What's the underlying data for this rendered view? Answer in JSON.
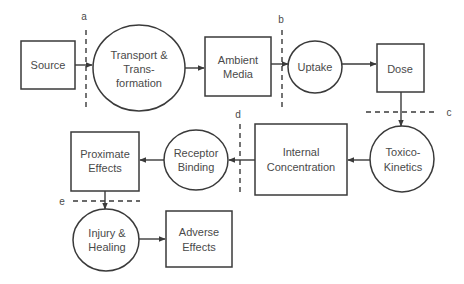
{
  "diagram": {
    "nodes": [
      {
        "id": "source",
        "shape": "rect",
        "lines": [
          "Source"
        ]
      },
      {
        "id": "transport",
        "shape": "ellipse",
        "lines": [
          "Transport &",
          "Trans-",
          "formation"
        ]
      },
      {
        "id": "ambient",
        "shape": "rect",
        "lines": [
          "Ambient",
          "Media"
        ]
      },
      {
        "id": "uptake",
        "shape": "ellipse",
        "lines": [
          "Uptake"
        ]
      },
      {
        "id": "dose",
        "shape": "rect",
        "lines": [
          "Dose"
        ]
      },
      {
        "id": "toxicokinetics",
        "shape": "ellipse",
        "lines": [
          "Toxico-",
          "Kinetics"
        ]
      },
      {
        "id": "internal",
        "shape": "rect",
        "lines": [
          "Internal",
          "Concentration"
        ]
      },
      {
        "id": "receptor",
        "shape": "ellipse",
        "lines": [
          "Receptor",
          "Binding"
        ]
      },
      {
        "id": "proximate",
        "shape": "rect",
        "lines": [
          "Proximate",
          "Effects"
        ]
      },
      {
        "id": "injury",
        "shape": "ellipse",
        "lines": [
          "Injury &",
          "Healing"
        ]
      },
      {
        "id": "adverse",
        "shape": "rect",
        "lines": [
          "Adverse",
          "Effects"
        ]
      }
    ],
    "edges": [
      [
        "source",
        "transport"
      ],
      [
        "transport",
        "ambient"
      ],
      [
        "ambient",
        "uptake"
      ],
      [
        "uptake",
        "dose"
      ],
      [
        "dose",
        "toxicokinetics"
      ],
      [
        "toxicokinetics",
        "internal"
      ],
      [
        "internal",
        "receptor"
      ],
      [
        "receptor",
        "proximate"
      ],
      [
        "proximate",
        "injury"
      ],
      [
        "injury",
        "adverse"
      ]
    ],
    "boundaries": [
      {
        "label": "a",
        "orientation": "vertical",
        "between": [
          "source",
          "transport"
        ]
      },
      {
        "label": "b",
        "orientation": "vertical",
        "between": [
          "ambient",
          "uptake"
        ]
      },
      {
        "label": "c",
        "orientation": "horizontal",
        "between": [
          "dose",
          "toxicokinetics"
        ]
      },
      {
        "label": "d",
        "orientation": "vertical",
        "between": [
          "internal",
          "receptor"
        ]
      },
      {
        "label": "e",
        "orientation": "horizontal",
        "between": [
          "proximate",
          "injury"
        ]
      }
    ]
  },
  "labels": {
    "source": [
      "Source"
    ],
    "transport": [
      "Transport &",
      "Trans-",
      "formation"
    ],
    "ambient": [
      "Ambient",
      "Media"
    ],
    "uptake": [
      "Uptake"
    ],
    "dose": [
      "Dose"
    ],
    "toxicokinetics": [
      "Toxico-",
      "Kinetics"
    ],
    "internal": [
      "Internal",
      "Concentration"
    ],
    "receptor": [
      "Receptor",
      "Binding"
    ],
    "proximate": [
      "Proximate",
      "Effects"
    ],
    "injury": [
      "Injury &",
      "Healing"
    ],
    "adverse": [
      "Adverse",
      "Effects"
    ],
    "a": "a",
    "b": "b",
    "c": "c",
    "d": "d",
    "e": "e"
  }
}
